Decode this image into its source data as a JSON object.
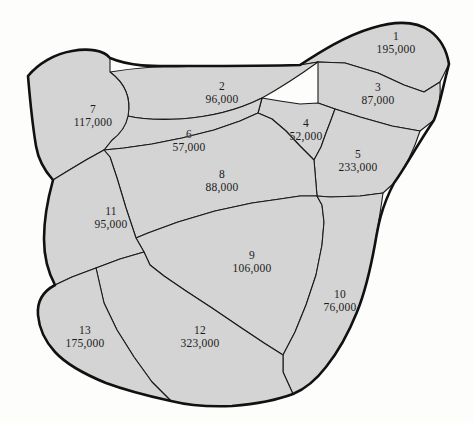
{
  "figure": {
    "kind": "choropleth-style region map",
    "background_color": "#fdfdfc",
    "region_fill_color": "#d4d4d4",
    "region_border_color": "#1a1a1a",
    "outline_color": "#111111"
  },
  "regions": [
    {
      "id": "1",
      "value": "195,000",
      "label_x": 396,
      "label_y": 43,
      "path": "M 300 65 C 320 52 345 36 372 28 C 395 21 416 21 430 31 C 441 39 447 52 449 64 L 440 82 L 424 92 L 404 85 L 378 73 L 345 63 L 318 62 Z"
    },
    {
      "id": "2",
      "value": "96,000",
      "label_x": 222,
      "label_y": 93,
      "path": "M 110 72 C 134 68 160 66 188 66 C 226 66 266 66 300 65 L 318 62 C 300 75 280 88 262 98 C 238 110 210 117 180 119 C 158 120 140 119 128 116 C 131 100 126 84 110 72 Z"
    },
    {
      "id": "3",
      "value": "87,000",
      "label_x": 378,
      "label_y": 94,
      "path": "M 318 62 L 345 63 L 378 73 L 404 85 L 424 92 L 440 82 C 441 95 439 108 434 120 L 420 131 L 392 126 L 360 117 L 335 109 L 318 103 C 318 89 318 75 318 62 Z"
    },
    {
      "id": "4",
      "value": "52,000",
      "label_x": 306,
      "label_y": 130,
      "path": "M 262 98 L 280 101 L 300 104 L 318 103 L 335 109 L 331 120 L 326 133 L 321 147 L 314 160 L 300 146 L 286 131 L 272 119 L 258 113 Z"
    },
    {
      "id": "5",
      "value": "233,000",
      "label_x": 358,
      "label_y": 161,
      "path": "M 335 109 L 360 117 L 392 126 L 420 131 C 414 150 405 168 394 183 L 383 193 L 360 196 L 330 197 L 317 196 L 314 160 L 321 147 L 326 133 L 331 120 Z"
    },
    {
      "id": "6",
      "value": "57,000",
      "label_x": 189,
      "label_y": 141,
      "path": "M 128 116 C 140 119 158 120 180 119 C 210 117 238 110 262 98 L 258 113 L 240 121 L 214 130 L 182 138 L 152 144 L 124 148 L 104 150 L 112 140 C 120 134 126 126 128 116 Z"
    },
    {
      "id": "7",
      "value": "117,000",
      "label_x": 93,
      "label_y": 116,
      "path": "M 28 76 C 38 64 54 54 72 51 C 88 48 104 50 110 58 L 110 72 C 126 84 131 100 128 116 C 126 126 120 134 112 140 L 104 150 L 86 160 L 66 172 L 53 180 C 44 170 38 158 36 146 C 33 128 30 100 28 76 Z"
    },
    {
      "id": "8",
      "value": "88,000",
      "label_x": 222,
      "label_y": 181,
      "path": "M 104 150 L 124 148 L 152 144 L 182 138 L 214 130 L 240 121 L 258 113 L 272 119 L 286 131 L 300 146 L 314 160 L 317 196 L 300 196 L 280 199 L 252 203 L 215 211 L 178 222 L 148 233 L 136 238 L 126 208 L 117 178 L 110 157 Z"
    },
    {
      "id": "9",
      "value": "106,000",
      "label_x": 252,
      "label_y": 262,
      "path": "M 136 238 L 148 233 L 178 222 L 215 211 L 252 203 L 280 199 L 300 196 L 317 196 L 322 205 L 324 222 L 322 245 L 316 275 L 306 305 L 295 332 L 283 355 L 264 343 L 240 327 L 212 308 L 186 291 L 164 276 L 150 265 L 144 252 Z"
    },
    {
      "id": "10",
      "value": "76,000",
      "label_x": 340,
      "label_y": 301,
      "path": "M 317 196 L 330 197 L 360 196 L 383 193 C 381 208 378 226 375 244 C 371 266 366 290 357 312 C 349 332 338 352 326 367 C 316 380 305 389 293 394 L 283 372 L 283 355 L 295 332 L 306 305 L 316 275 L 322 245 L 324 222 L 322 205 Z"
    },
    {
      "id": "11",
      "value": "95,000",
      "label_x": 111,
      "label_y": 218,
      "path": "M 53 180 L 66 172 L 86 160 L 104 150 L 110 157 L 117 178 L 126 208 L 136 238 L 144 252 L 120 259 L 96 268 L 72 277 L 55 285 C 48 272 44 256 44 239 C 44 220 48 198 53 180 Z"
    },
    {
      "id": "12",
      "value": "323,000",
      "label_x": 200,
      "label_y": 337,
      "path": "M 96 268 L 120 259 L 144 252 L 150 265 L 164 276 L 186 291 L 212 308 L 240 327 L 264 343 L 283 355 L 283 372 L 293 394 C 277 400 256 404 232 406 C 208 407 187 405 171 401 L 152 382 L 134 357 L 117 330 L 104 303 Z"
    },
    {
      "id": "13",
      "value": "175,000",
      "label_x": 85,
      "label_y": 337,
      "path": "M 55 285 L 72 277 L 96 268 L 104 303 L 117 330 L 134 357 L 152 382 L 171 401 C 148 396 125 390 106 383 C 84 374 66 364 55 352 C 44 340 39 327 38 315 C 37 303 42 292 55 285 Z"
    }
  ],
  "outer_boundary": {
    "path": "M 28 76 C 38 64 54 54 72 51 C 88 48 104 50 110 58 C 134 68 160 66 188 66 C 226 66 266 66 300 65 C 320 52 345 36 372 28 C 395 21 416 21 430 31 C 441 39 447 52 449 64 C 441 95 439 108 434 120 C 414 150 405 168 394 183 C 381 208 378 226 375 244 C 371 266 366 290 357 312 C 349 332 338 352 326 367 C 316 380 305 389 293 394 C 277 400 256 404 232 406 C 208 407 187 405 171 401 C 148 396 125 390 106 383 C 84 374 66 364 55 352 C 44 340 39 327 38 315 C 37 303 42 292 55 285 C 48 272 44 256 44 239 C 44 220 48 198 53 180 C 44 170 38 158 36 146 C 33 128 30 100 28 76 Z"
  }
}
